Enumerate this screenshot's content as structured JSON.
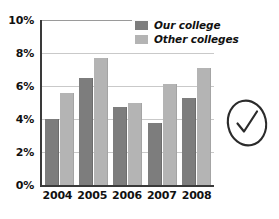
{
  "chart_data": {
    "type": "bar",
    "title": "",
    "xlabel": "",
    "ylabel": "",
    "categories": [
      "2004",
      "2005",
      "2006",
      "2007",
      "2008"
    ],
    "series": [
      {
        "name": "Our college",
        "color": "#7d7d7d",
        "values": [
          4.0,
          6.5,
          4.7,
          3.75,
          5.25
        ]
      },
      {
        "name": "Other colleges",
        "color": "#b4b4b4",
        "values": [
          5.6,
          7.7,
          5.0,
          6.1,
          7.1
        ]
      }
    ],
    "ylim": [
      0,
      10
    ],
    "yticks": [
      "0%",
      "2%",
      "4%",
      "6%",
      "8%",
      "10%"
    ],
    "ytick_values": [
      0,
      2,
      4,
      6,
      8,
      10
    ],
    "grid": true,
    "legend_position": "top-right",
    "unit": "%"
  },
  "legend": {
    "items": [
      {
        "label": "Our college"
      },
      {
        "label": "Other colleges"
      }
    ]
  },
  "annotations": {
    "check_mark": "circled-check-mark"
  }
}
